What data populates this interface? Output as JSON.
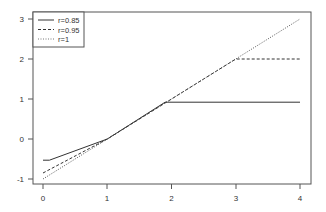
{
  "chart_data": {
    "type": "line",
    "title": "",
    "xlabel": "",
    "ylabel": "",
    "xlim": [
      0,
      4
    ],
    "ylim": [
      -1,
      3
    ],
    "x_ticks": [
      "0",
      "1",
      "2",
      "3",
      "4"
    ],
    "y_ticks": [
      "-1",
      "0",
      "1",
      "2",
      "3"
    ],
    "grid": false,
    "legend_position": "top-left",
    "series": [
      {
        "name": "r=0.85",
        "style": "solid",
        "color": "#333333",
        "points": [
          [
            0,
            -0.53
          ],
          [
            0.1,
            -0.53
          ],
          [
            1,
            0
          ],
          [
            1.9,
            0.92
          ],
          [
            4,
            0.92
          ]
        ]
      },
      {
        "name": "r=0.95",
        "style": "dashed",
        "color": "#333333",
        "points": [
          [
            0,
            -0.85
          ],
          [
            1,
            0
          ],
          [
            3,
            2
          ],
          [
            4,
            2
          ]
        ]
      },
      {
        "name": "r=1",
        "style": "dotted",
        "color": "#555555",
        "points": [
          [
            0,
            -1
          ],
          [
            4,
            3
          ]
        ]
      }
    ]
  },
  "legend": {
    "items": [
      {
        "label": "r=0.85"
      },
      {
        "label": "r=0.95"
      },
      {
        "label": "r=1"
      }
    ]
  },
  "axes": {
    "x_ticks": [
      "0",
      "1",
      "2",
      "3",
      "4"
    ],
    "y_ticks": [
      "-1",
      "0",
      "1",
      "2",
      "3"
    ]
  }
}
